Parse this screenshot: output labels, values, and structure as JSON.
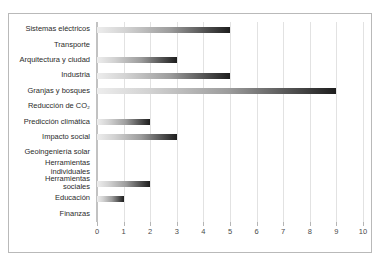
{
  "chart_data": {
    "type": "bar",
    "orientation": "horizontal",
    "title": "",
    "subtitle": "",
    "xlabel": "",
    "ylabel": "",
    "xlim": [
      0,
      10
    ],
    "ylim": null,
    "grid": true,
    "legend": false,
    "legend_position": "none",
    "xticks": [
      "0",
      "1",
      "2",
      "3",
      "4",
      "5",
      "6",
      "7",
      "8",
      "9",
      "10"
    ],
    "categories": [
      "Sistemas eléctricos",
      "Transporte",
      "Arquitectura y ciudad",
      "Industria",
      "Granjas y bosques",
      "Reducción de CO₂",
      "Predicción climática",
      "Impacto social",
      "Geoingeniería solar",
      "Herramientas\nindividuales",
      "Herramientas\nsociales",
      "Educación",
      "Finanzas"
    ],
    "values": [
      5,
      0,
      3,
      5,
      9,
      0,
      2,
      3,
      0,
      0,
      2,
      1,
      0
    ],
    "bar_gradient_from": "#ededed",
    "bar_gradient_to": "#1d1d1d",
    "gridline_color": "#e2e2e2",
    "axis_color": "#c2c2c2",
    "frame_color": "#b9b9b9",
    "background": "#ffffff",
    "text_color": "#2b2b2b"
  }
}
